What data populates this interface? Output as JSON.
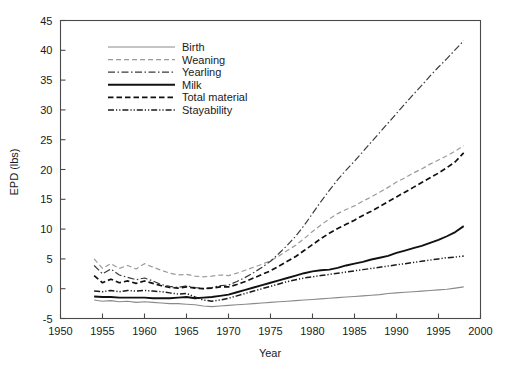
{
  "chart_data": {
    "type": "line",
    "title": "",
    "xlabel": "Year",
    "ylabel": "EPD (lbs)",
    "xlim": [
      1950,
      2000
    ],
    "ylim": [
      -5,
      45
    ],
    "xticks": [
      1950,
      1955,
      1960,
      1965,
      1970,
      1975,
      1980,
      1985,
      1990,
      1995,
      2000
    ],
    "yticks": [
      -5,
      0,
      5,
      10,
      15,
      20,
      25,
      30,
      35,
      40,
      45
    ],
    "xtick_labels": [
      "1950",
      "1955",
      "1960",
      "1965",
      "1970",
      "1975",
      "1980",
      "1985",
      "1990",
      "1995",
      "2000"
    ],
    "ytick_labels": [
      "-5",
      "0",
      "5",
      "10",
      "15",
      "20",
      "25",
      "30",
      "35",
      "40",
      "45"
    ],
    "grid": false,
    "legend_position": "upper-left-inside",
    "x": [
      1954,
      1955,
      1956,
      1957,
      1958,
      1959,
      1960,
      1961,
      1962,
      1963,
      1964,
      1965,
      1966,
      1967,
      1968,
      1969,
      1970,
      1971,
      1972,
      1973,
      1974,
      1975,
      1976,
      1977,
      1978,
      1979,
      1980,
      1981,
      1982,
      1983,
      1984,
      1985,
      1986,
      1987,
      1988,
      1989,
      1990,
      1991,
      1992,
      1993,
      1994,
      1995,
      1996,
      1997,
      1998
    ],
    "series": [
      {
        "name": "Birth",
        "style": "solid-thin-gray",
        "color": "#8a8a8a",
        "width": 1.1,
        "dash": "none",
        "values": [
          -1.9,
          -2.1,
          -2.0,
          -2.2,
          -2.1,
          -2.3,
          -2.2,
          -2.3,
          -2.4,
          -2.5,
          -2.5,
          -2.6,
          -2.7,
          -2.9,
          -3.0,
          -2.9,
          -2.8,
          -2.7,
          -2.6,
          -2.5,
          -2.4,
          -2.3,
          -2.2,
          -2.1,
          -2.0,
          -1.9,
          -1.8,
          -1.7,
          -1.6,
          -1.5,
          -1.4,
          -1.3,
          -1.2,
          -1.1,
          -1.0,
          -0.8,
          -0.7,
          -0.6,
          -0.5,
          -0.4,
          -0.3,
          -0.2,
          -0.1,
          0.1,
          0.3
        ]
      },
      {
        "name": "Weaning",
        "style": "dashed-gray",
        "color": "#9a9a9a",
        "width": 1.2,
        "dash": "5,3",
        "values": [
          5.0,
          3.4,
          4.2,
          3.4,
          3.9,
          3.3,
          4.2,
          3.6,
          3.1,
          2.6,
          2.3,
          2.4,
          2.1,
          2.0,
          2.1,
          2.3,
          2.2,
          2.6,
          3.1,
          3.6,
          4.1,
          4.7,
          5.5,
          6.4,
          7.3,
          8.4,
          9.6,
          10.7,
          11.7,
          12.6,
          13.3,
          13.9,
          14.7,
          15.4,
          16.2,
          17.0,
          17.9,
          18.6,
          19.4,
          20.1,
          20.9,
          21.6,
          22.3,
          23.1,
          24.0
        ]
      },
      {
        "name": "Yearling",
        "style": "dash-dot-thin",
        "color": "#3a3a3a",
        "width": 1.2,
        "dash": "7,2.5,1.5,2.5",
        "values": [
          3.9,
          2.5,
          3.3,
          2.3,
          1.9,
          1.5,
          1.8,
          1.3,
          0.7,
          0.4,
          0.2,
          0.5,
          0.2,
          0.0,
          0.2,
          0.5,
          0.6,
          1.2,
          1.9,
          2.7,
          3.6,
          4.6,
          5.9,
          7.3,
          8.8,
          10.6,
          12.6,
          14.6,
          16.5,
          18.3,
          19.9,
          21.4,
          23.0,
          24.6,
          26.2,
          27.8,
          29.4,
          31.0,
          32.6,
          34.1,
          35.7,
          37.2,
          38.6,
          40.1,
          41.6
        ]
      },
      {
        "name": "Milk",
        "style": "solid-thick",
        "color": "#111111",
        "width": 1.9,
        "dash": "none",
        "values": [
          -1.3,
          -1.4,
          -1.4,
          -1.5,
          -1.5,
          -1.5,
          -1.5,
          -1.6,
          -1.6,
          -1.6,
          -1.5,
          -1.4,
          -1.6,
          -1.5,
          -1.4,
          -1.2,
          -1.0,
          -0.6,
          -0.2,
          0.2,
          0.6,
          1.0,
          1.4,
          1.8,
          2.2,
          2.6,
          2.9,
          3.1,
          3.2,
          3.5,
          3.9,
          4.2,
          4.5,
          4.9,
          5.2,
          5.5,
          6.0,
          6.4,
          6.8,
          7.2,
          7.7,
          8.2,
          8.8,
          9.5,
          10.5
        ]
      },
      {
        "name": "Total material",
        "style": "dashed-black",
        "color": "#111111",
        "width": 1.7,
        "dash": "5.5,3",
        "values": [
          2.2,
          1.0,
          1.6,
          1.0,
          1.3,
          0.9,
          1.3,
          0.9,
          0.5,
          0.2,
          0.1,
          0.3,
          0.1,
          0.0,
          0.1,
          0.3,
          0.3,
          0.7,
          1.2,
          1.8,
          2.4,
          3.0,
          3.8,
          4.6,
          5.4,
          6.4,
          7.4,
          8.4,
          9.3,
          10.1,
          10.8,
          11.5,
          12.3,
          13.0,
          13.8,
          14.6,
          15.4,
          16.2,
          17.0,
          17.8,
          18.6,
          19.4,
          20.3,
          21.3,
          22.8
        ]
      },
      {
        "name": "Stayability",
        "style": "dash-dot-dot",
        "color": "#1a1a1a",
        "width": 1.5,
        "dash": "6,2,1.2,2,1.2,2",
        "values": [
          -0.4,
          -0.5,
          -0.3,
          -0.5,
          -0.3,
          -0.4,
          -0.3,
          -0.4,
          -0.5,
          -0.7,
          -0.9,
          -0.8,
          -1.4,
          -1.9,
          -2.1,
          -1.9,
          -1.6,
          -1.2,
          -0.8,
          -0.4,
          0.0,
          0.4,
          0.8,
          1.2,
          1.5,
          1.8,
          2.0,
          2.2,
          2.4,
          2.6,
          2.8,
          3.0,
          3.2,
          3.4,
          3.6,
          3.8,
          4.0,
          4.2,
          4.4,
          4.6,
          4.8,
          5.0,
          5.2,
          5.3,
          5.5
        ]
      }
    ],
    "legend_entries": [
      {
        "label": "Birth",
        "sample": "solid-thin-gray"
      },
      {
        "label": "Weaning",
        "sample": "dashed-gray"
      },
      {
        "label": "Yearling",
        "sample": "dash-dot-thin"
      },
      {
        "label": "Milk",
        "sample": "solid-thick"
      },
      {
        "label": "Total material",
        "sample": "dashed-black"
      },
      {
        "label": "Stayability",
        "sample": "dash-dot-dot"
      }
    ]
  },
  "colors": {
    "background": "#ffffff",
    "axis": "#4a4a4a",
    "text": "#1a1a1a",
    "gray_series": "#8a8a8a",
    "black_series": "#111111"
  }
}
